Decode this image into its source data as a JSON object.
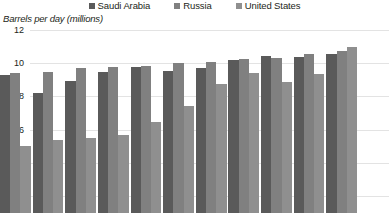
{
  "legend": {
    "items": [
      {
        "label": "Saudi Arabia",
        "color": "#5a5a5a"
      },
      {
        "label": "Russia",
        "color": "#808080"
      },
      {
        "label": "United States",
        "color": "#8f8f8f"
      }
    ]
  },
  "axis": {
    "title": "Barrels per day (millions)",
    "ticks": [
      "12",
      "10",
      "8",
      "6",
      "4",
      "2"
    ]
  },
  "chart_data": {
    "type": "bar",
    "title": "",
    "subtitle": "",
    "xlabel": "",
    "ylabel": "Barrels per day (millions)",
    "ylim": [
      0,
      12
    ],
    "ytick_values": [
      12,
      10,
      8,
      6,
      4,
      2
    ],
    "grid": true,
    "legend_position": "top-center",
    "categories": [
      "1",
      "2",
      "3",
      "4",
      "5",
      "6",
      "7",
      "8",
      "9",
      "10",
      "11"
    ],
    "series": [
      {
        "name": "Saudi Arabia",
        "color": "#5a5a5a",
        "values": [
          9.3,
          8.2,
          8.9,
          9.45,
          9.8,
          9.55,
          9.7,
          10.2,
          10.45,
          10.4,
          10.55
        ]
      },
      {
        "name": "Russia",
        "color": "#808080",
        "values": [
          9.4,
          9.5,
          9.7,
          9.75,
          9.85,
          10.0,
          10.1,
          10.25,
          10.3,
          10.55,
          10.75
        ]
      },
      {
        "name": "United States",
        "color": "#8f8f8f",
        "values": [
          5.0,
          5.35,
          5.5,
          5.65,
          6.45,
          7.45,
          8.75,
          9.4,
          8.85,
          9.35,
          10.95
        ]
      }
    ],
    "note": "Bottom of plot is cropped by the screenshot frame; bars extend below the visible area."
  }
}
